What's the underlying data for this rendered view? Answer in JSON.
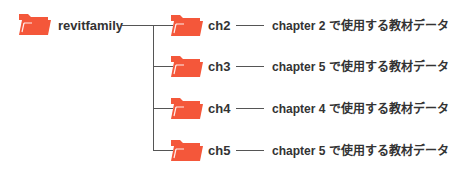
{
  "root": {
    "label": "revitfamily",
    "icon": "folder-icon",
    "color": "#f4573a"
  },
  "children": [
    {
      "label": "ch2",
      "description": "chapter 2 で使用する教材データ"
    },
    {
      "label": "ch3",
      "description": "chapter 5 で使用する教材データ"
    },
    {
      "label": "ch4",
      "description": "chapter 4 で使用する教材データ"
    },
    {
      "label": "ch5",
      "description": "chapter 5 で使用する教材データ"
    }
  ],
  "colors": {
    "folder": "#f4573a",
    "folder_tab": "#f26f55",
    "line": "#555555",
    "text": "#333333"
  }
}
